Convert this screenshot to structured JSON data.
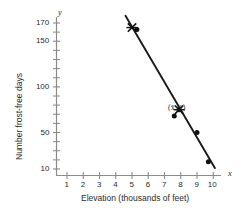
{
  "chart_data": {
    "type": "scatter",
    "title": "",
    "xlabel": "Elevation (thousands of feet)",
    "ylabel": "Number frost-free days",
    "x_axis_name": "x",
    "y_axis_name": "y",
    "xlim": [
      0,
      10.6
    ],
    "ylim": [
      0,
      182
    ],
    "xticks": [
      1,
      2,
      3,
      4,
      5,
      6,
      7,
      8,
      9,
      10
    ],
    "xtick_labels": [
      "1",
      "2",
      "3",
      "4",
      "5",
      "6",
      "7",
      "8",
      "9",
      "10"
    ],
    "yticks_labeled": [
      10,
      50,
      100,
      150,
      170
    ],
    "ytick_labels": [
      "10",
      "50",
      "100",
      "150",
      "170"
    ],
    "yticks_minor": [
      20,
      30,
      40,
      60,
      70,
      80,
      90,
      110,
      120,
      130,
      140,
      160
    ],
    "grid": false,
    "legend": null,
    "points": [
      {
        "x": 5.3,
        "y": 163
      },
      {
        "x": 7.6,
        "y": 68
      },
      {
        "x": 7.9,
        "y": 75
      },
      {
        "x": 9.0,
        "y": 50
      },
      {
        "x": 9.7,
        "y": 18
      }
    ],
    "mean_markers": [
      {
        "x": 5.0,
        "y": 165,
        "marker": "cross",
        "label": ""
      },
      {
        "x": 7.9,
        "y": 75,
        "marker": "cross",
        "label": "(x̄, ȳ)"
      }
    ],
    "regression_line": {
      "x1": 4.6,
      "y1": 178,
      "x2": 10.1,
      "y2": 11,
      "color": "#1a1a1a"
    },
    "colors": {
      "axis": "#8a8a8a",
      "point": "#111111",
      "line": "#1a1a1a",
      "text": "#2b2b2b"
    },
    "annotations": [
      {
        "text": "(x̄, ȳ)",
        "x": 8.4,
        "y": 80
      }
    ]
  }
}
